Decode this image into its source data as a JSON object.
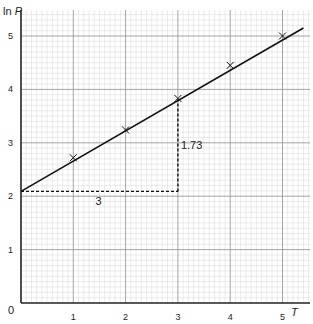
{
  "chart_data": {
    "type": "line",
    "title": "",
    "xlabel": "T",
    "ylabel": "ln P",
    "origin_label": "0",
    "xlim": [
      0,
      5.5
    ],
    "ylim": [
      0,
      5.5
    ],
    "x_ticks": [
      1,
      2,
      3,
      4,
      5
    ],
    "y_ticks": [
      1,
      2,
      3,
      4,
      5
    ],
    "grid": true,
    "minor_grid_per_unit": 10,
    "points": [
      {
        "x": 1,
        "y": 2.72
      },
      {
        "x": 2,
        "y": 3.24
      },
      {
        "x": 3,
        "y": 3.83
      },
      {
        "x": 4,
        "y": 4.45
      },
      {
        "x": 5,
        "y": 5.0
      }
    ],
    "best_fit_line": {
      "x0": 0,
      "y0": 2.09,
      "x1": 5.4,
      "y1": 5.15,
      "slope": 0.577,
      "intercept": 2.09
    },
    "gradient_triangle": {
      "run": 3,
      "rise": 1.73,
      "run_label": "3",
      "rise_label": "1.73",
      "from": {
        "x": 0,
        "y": 2.09
      },
      "corner": {
        "x": 3,
        "y": 2.09
      },
      "to": {
        "x": 3,
        "y": 3.82
      }
    },
    "colors": {
      "line": "#111111",
      "major_grid": "#9a9a9a",
      "minor_grid": "#dedede",
      "axis": "#222222"
    }
  }
}
